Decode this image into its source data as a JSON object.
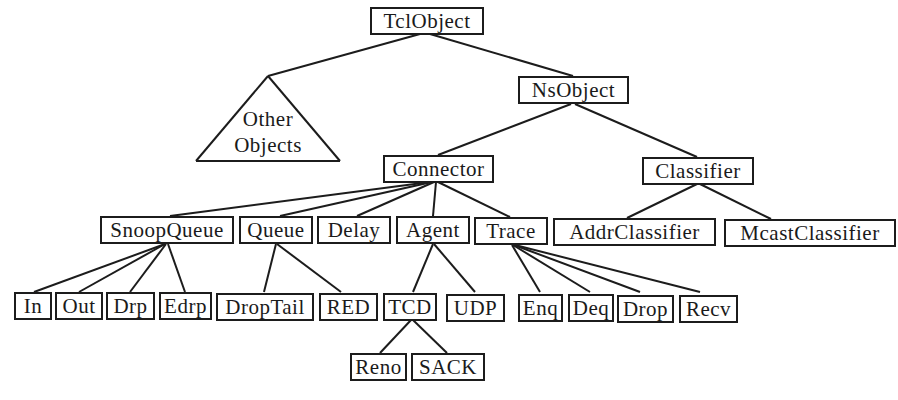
{
  "diagram": {
    "type": "class-hierarchy-tree",
    "root": "TclObject",
    "nodes": {
      "tclobject": {
        "label": "TclObject"
      },
      "other_objects": {
        "label_line1": "Other",
        "label_line2": "Objects",
        "shape": "triangle"
      },
      "nsobject": {
        "label": "NsObject"
      },
      "connector": {
        "label": "Connector"
      },
      "classifier": {
        "label": "Classifier"
      },
      "snoopqueue": {
        "label": "SnoopQueue"
      },
      "queue": {
        "label": "Queue"
      },
      "delay": {
        "label": "Delay"
      },
      "agent": {
        "label": "Agent"
      },
      "trace": {
        "label": "Trace"
      },
      "addrclassifier": {
        "label": "AddrClassifier"
      },
      "mcastclassifier": {
        "label": "McastClassifier"
      },
      "in": {
        "label": "In"
      },
      "out": {
        "label": "Out"
      },
      "drp": {
        "label": "Drp"
      },
      "edrp": {
        "label": "Edrp"
      },
      "droptail": {
        "label": "DropTail"
      },
      "red": {
        "label": "RED"
      },
      "tcd": {
        "label": "TCD"
      },
      "udp": {
        "label": "UDP"
      },
      "enq": {
        "label": "Enq"
      },
      "deq": {
        "label": "Deq"
      },
      "drop": {
        "label": "Drop"
      },
      "recv": {
        "label": "Recv"
      },
      "reno": {
        "label": "Reno"
      },
      "sack": {
        "label": "SACK"
      }
    },
    "edges": [
      [
        "TclObject",
        "Other Objects"
      ],
      [
        "TclObject",
        "NsObject"
      ],
      [
        "NsObject",
        "Connector"
      ],
      [
        "NsObject",
        "Classifier"
      ],
      [
        "Connector",
        "SnoopQueue"
      ],
      [
        "Connector",
        "Queue"
      ],
      [
        "Connector",
        "Delay"
      ],
      [
        "Connector",
        "Agent"
      ],
      [
        "Connector",
        "Trace"
      ],
      [
        "Classifier",
        "AddrClassifier"
      ],
      [
        "Classifier",
        "McastClassifier"
      ],
      [
        "SnoopQueue",
        "In"
      ],
      [
        "SnoopQueue",
        "Out"
      ],
      [
        "SnoopQueue",
        "Drp"
      ],
      [
        "SnoopQueue",
        "Edrp"
      ],
      [
        "Queue",
        "DropTail"
      ],
      [
        "Queue",
        "RED"
      ],
      [
        "Agent",
        "TCD"
      ],
      [
        "Agent",
        "UDP"
      ],
      [
        "Trace",
        "Enq"
      ],
      [
        "Trace",
        "Deq"
      ],
      [
        "Trace",
        "Drop"
      ],
      [
        "Trace",
        "Recv"
      ],
      [
        "TCD",
        "Reno"
      ],
      [
        "TCD",
        "SACK"
      ]
    ],
    "colors": {
      "line": "#1c1c1c",
      "background": "#ffffff",
      "text": "#1a1a1a"
    }
  }
}
